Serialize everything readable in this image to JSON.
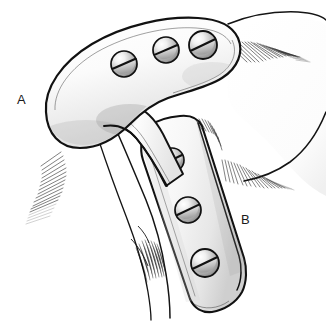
{
  "figure": {
    "background_color": "#ffffff",
    "line_color": "#111111",
    "plate_fill": "#f2f2f2",
    "screw_fill": "#bfbfbf",
    "shadow_color": "#555555"
  },
  "labels": [
    {
      "id": "A",
      "text": "A",
      "x": 17,
      "y": 93,
      "refers_to": "horizontal-plate"
    },
    {
      "id": "B",
      "text": "B",
      "x": 241,
      "y": 213,
      "refers_to": "vertical-plate"
    }
  ],
  "plates": [
    {
      "name": "horizontal-plate",
      "label": "A",
      "orientation": "horizontal-curved",
      "screw_count": 3,
      "screws": [
        {
          "index": 1,
          "cx": 124,
          "cy": 64,
          "r": 13,
          "slot_angle": -22
        },
        {
          "index": 2,
          "cx": 166,
          "cy": 50,
          "r": 13,
          "slot_angle": -20
        },
        {
          "index": 3,
          "cx": 203,
          "cy": 45,
          "r": 14,
          "slot_angle": -20
        }
      ]
    },
    {
      "name": "vertical-plate",
      "label": "B",
      "orientation": "oblique-descending",
      "screw_count": 3,
      "screws": [
        {
          "index": 1,
          "cx": 172,
          "cy": 160,
          "r": 12,
          "slot_angle": -22
        },
        {
          "index": 2,
          "cx": 188,
          "cy": 210,
          "r": 13,
          "slot_angle": -22
        },
        {
          "index": 3,
          "cx": 205,
          "cy": 263,
          "r": 14,
          "slot_angle": -22
        }
      ]
    }
  ],
  "anatomy": [
    {
      "name": "bone-body-right",
      "description": "large rounded bone mass upper right with hatched soft-tissue margin"
    },
    {
      "name": "bone-neck-center",
      "description": "narrow bone neck descending from under the horizontal plate"
    },
    {
      "name": "soft-tissue-hatch-left",
      "description": "fine hatch shading lower-left of horizontal plate"
    },
    {
      "name": "soft-tissue-hatch-right",
      "description": "fine hatch shading right of vertical plate"
    }
  ]
}
